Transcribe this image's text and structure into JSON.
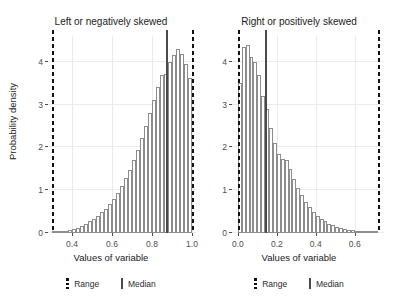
{
  "chart_data": [
    {
      "type": "bar",
      "title": "Left or negatively skewed",
      "xlabel": "Values of variable",
      "ylabel": "Probability density",
      "xlim": [
        0.28,
        1.02
      ],
      "ylim": [
        0,
        4.6
      ],
      "xticks": [
        "0.4",
        "0.6",
        "0.8",
        "1.0"
      ],
      "xtick_values": [
        0.4,
        0.6,
        0.8,
        1.0
      ],
      "yticks": [
        "0",
        "1",
        "2",
        "3",
        "4"
      ],
      "ytick_values": [
        0,
        1,
        2,
        3,
        4
      ],
      "grid": true,
      "legend_position": "bottom",
      "bin_width": 0.02,
      "bin_centers": [
        0.31,
        0.33,
        0.35,
        0.37,
        0.39,
        0.41,
        0.43,
        0.45,
        0.47,
        0.49,
        0.51,
        0.53,
        0.55,
        0.57,
        0.59,
        0.61,
        0.63,
        0.65,
        0.67,
        0.69,
        0.71,
        0.73,
        0.75,
        0.77,
        0.79,
        0.81,
        0.83,
        0.85,
        0.87,
        0.89,
        0.91,
        0.93,
        0.95,
        0.97,
        0.99
      ],
      "values": [
        0.02,
        0.03,
        0.04,
        0.05,
        0.07,
        0.09,
        0.12,
        0.16,
        0.21,
        0.27,
        0.33,
        0.4,
        0.48,
        0.57,
        0.68,
        0.8,
        0.94,
        1.1,
        1.28,
        1.48,
        1.7,
        1.95,
        2.22,
        2.5,
        2.8,
        3.1,
        3.42,
        3.7,
        3.72,
        4.0,
        4.16,
        4.3,
        4.18,
        3.95,
        3.62
      ],
      "annotations": [
        {
          "name": "range-min",
          "type": "vline",
          "style": "dashed",
          "x": 0.3
        },
        {
          "name": "range-max",
          "type": "vline",
          "style": "dashed",
          "x": 1.0
        },
        {
          "name": "median",
          "type": "vline",
          "style": "solid",
          "x": 0.87
        }
      ],
      "legend": [
        {
          "label": "Range",
          "style": "dashed"
        },
        {
          "label": "Median",
          "style": "solid"
        }
      ]
    },
    {
      "type": "bar",
      "title": "Right or positively skewed",
      "xlabel": "Values of variable",
      "ylabel": "Probability density",
      "xlim": [
        -0.03,
        0.75
      ],
      "ylim": [
        0,
        4.6
      ],
      "xticks": [
        "0.0",
        "0.2",
        "0.4",
        "0.6"
      ],
      "xtick_values": [
        0.0,
        0.2,
        0.4,
        0.6
      ],
      "yticks": [
        "0",
        "1",
        "2",
        "3",
        "4"
      ],
      "ytick_values": [
        0,
        1,
        2,
        3,
        4
      ],
      "grid": true,
      "legend_position": "bottom",
      "bin_width": 0.02,
      "bin_centers": [
        0.01,
        0.03,
        0.05,
        0.07,
        0.09,
        0.11,
        0.13,
        0.15,
        0.17,
        0.19,
        0.21,
        0.23,
        0.25,
        0.27,
        0.29,
        0.31,
        0.33,
        0.35,
        0.37,
        0.39,
        0.41,
        0.43,
        0.45,
        0.47,
        0.49,
        0.51,
        0.53,
        0.55,
        0.57,
        0.59,
        0.61,
        0.63,
        0.65,
        0.67,
        0.69,
        0.71
      ],
      "values": [
        3.5,
        4.35,
        4.4,
        4.1,
        4.0,
        3.7,
        3.2,
        2.9,
        2.45,
        2.1,
        1.85,
        1.72,
        1.7,
        1.5,
        1.25,
        1.05,
        0.88,
        0.72,
        0.6,
        0.5,
        0.4,
        0.33,
        0.27,
        0.22,
        0.18,
        0.15,
        0.12,
        0.1,
        0.08,
        0.06,
        0.05,
        0.04,
        0.03,
        0.02,
        0.02,
        0.01
      ],
      "annotations": [
        {
          "name": "range-min",
          "type": "vline",
          "style": "dashed",
          "x": 0.0
        },
        {
          "name": "range-max",
          "type": "vline",
          "style": "dashed",
          "x": 0.72
        },
        {
          "name": "median",
          "type": "vline",
          "style": "solid",
          "x": 0.14
        }
      ],
      "legend": [
        {
          "label": "Range",
          "style": "dashed"
        },
        {
          "label": "Median",
          "style": "solid"
        }
      ]
    }
  ],
  "shared": {
    "ylabel": "Probability density"
  }
}
